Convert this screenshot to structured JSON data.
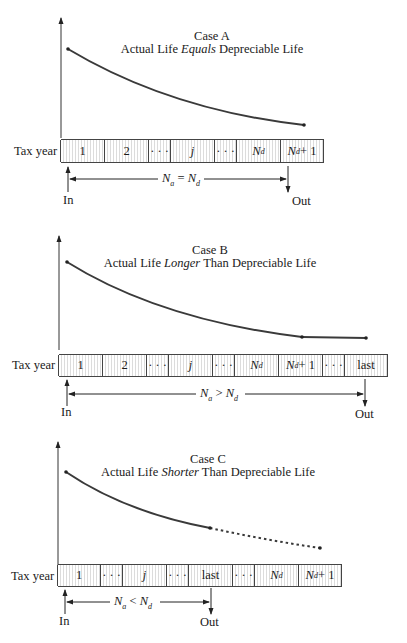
{
  "figure": {
    "cases": [
      {
        "id": "A",
        "heading": "Case A",
        "subtitle_pre": "Actual Life ",
        "subtitle_emph": "Equals",
        "subtitle_post": " Depreciable Life",
        "row_label": "Tax year",
        "cells": [
          {
            "text": "1",
            "italic": false
          },
          {
            "text": "2",
            "italic": false
          },
          {
            "text": "· · ·",
            "italic": false
          },
          {
            "text": "j",
            "italic": true
          },
          {
            "text": "· · ·",
            "italic": false
          },
          {
            "text": "N",
            "sub": "d",
            "italic": true
          },
          {
            "text": "N",
            "sub": "d",
            "suffix": " + 1",
            "italic": true
          }
        ],
        "span": {
          "lhs": "N",
          "lhs_sub": "a",
          "op": " = ",
          "rhs": "N",
          "rhs_sub": "d"
        },
        "in_label": "In",
        "out_label": "Out",
        "curve": "declining book value, ends at start of year N_d + 1"
      },
      {
        "id": "B",
        "heading": "Case B",
        "subtitle_pre": "Actual Life ",
        "subtitle_emph": "Longer",
        "subtitle_post": " Than Depreciable Life",
        "row_label": "Tax year",
        "cells": [
          {
            "text": "1",
            "italic": false
          },
          {
            "text": "2",
            "italic": false
          },
          {
            "text": "· · ·",
            "italic": false
          },
          {
            "text": "j",
            "italic": true
          },
          {
            "text": "· · ·",
            "italic": false
          },
          {
            "text": "N",
            "sub": "d",
            "italic": true
          },
          {
            "text": "N",
            "sub": "d",
            "suffix": " + 1",
            "italic": true
          },
          {
            "text": "· · ·",
            "italic": false
          },
          {
            "text": "last",
            "italic": false
          }
        ],
        "span": {
          "lhs": "N",
          "lhs_sub": "a",
          "op": " > ",
          "rhs": "N",
          "rhs_sub": "d"
        },
        "in_label": "In",
        "out_label": "Out",
        "curve": "declining book value to N_d + 1, then flat until last"
      },
      {
        "id": "C",
        "heading": "Case C",
        "subtitle_pre": "Actual Life ",
        "subtitle_emph": "Shorter",
        "subtitle_post": " Than Depreciable Life",
        "row_label": "Tax year",
        "cells": [
          {
            "text": "1",
            "italic": false
          },
          {
            "text": "· · ·",
            "italic": false
          },
          {
            "text": "j",
            "italic": true
          },
          {
            "text": "· · ·",
            "italic": false
          },
          {
            "text": "last",
            "italic": false
          },
          {
            "text": "· · ·",
            "italic": false
          },
          {
            "text": "N",
            "sub": "d",
            "italic": true
          },
          {
            "text": "N",
            "sub": "d",
            "suffix": " + 1",
            "italic": true
          }
        ],
        "span": {
          "lhs": "N",
          "lhs_sub": "a",
          "op": " < ",
          "rhs": "N",
          "rhs_sub": "d"
        },
        "in_label": "In",
        "out_label": "Out",
        "curve": "solid declining book value until last, dotted continuation to N_d + 1"
      }
    ],
    "colors": {
      "curve": "#3a3a3a",
      "axis": "#333333",
      "cell_hatch": "#dcdcdc",
      "cell_border": "#444444",
      "caption": "#9a9a9a"
    }
  }
}
